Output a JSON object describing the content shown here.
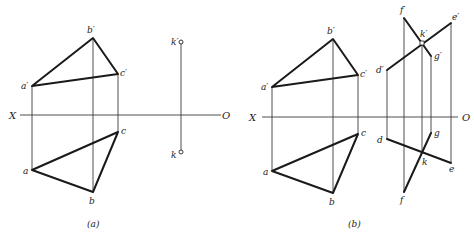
{
  "figures": [
    {
      "id": "a",
      "caption": "(a)",
      "axis": {
        "left_label": "X",
        "right_label": "O"
      },
      "points": {
        "a_prime": "a′",
        "b_prime": "b′",
        "c_prime": "c′",
        "a": "a",
        "b": "b",
        "c": "c",
        "k_prime": "k′",
        "k": "k"
      }
    },
    {
      "id": "b",
      "caption": "(b)",
      "axis": {
        "left_label": "X",
        "right_label": "O"
      },
      "points": {
        "a_prime": "a′",
        "b_prime": "b′",
        "c_prime": "c′",
        "a": "a",
        "b": "b",
        "c": "c",
        "d_prime": "d′",
        "e_prime": "e′",
        "f_prime": "f′",
        "g_prime": "g′",
        "k_prime": "k′",
        "d": "d",
        "e": "e",
        "f": "f",
        "g": "g",
        "k": "k"
      }
    }
  ]
}
